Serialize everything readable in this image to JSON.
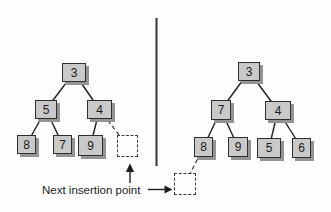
{
  "annotation": {
    "label": "Next insertion point"
  },
  "left_tree": {
    "nodes": {
      "root": "3",
      "l": "5",
      "r": "4",
      "ll": "8",
      "lr": "7",
      "rl": "9"
    },
    "insertion_placeholder": "right child of 4"
  },
  "right_tree": {
    "nodes": {
      "root": "3",
      "l": "7",
      "r": "4",
      "ll": "8",
      "lr": "9",
      "rl": "5",
      "rr": "6"
    },
    "insertion_placeholder": "left child of 8"
  },
  "colors": {
    "node_fill": "#c9c9c9",
    "node_border": "#2e2e2e",
    "node_shadow": "#949494",
    "edge_line": "#1f1f1f",
    "divider": "#333333",
    "background": "#fdfdfd"
  }
}
